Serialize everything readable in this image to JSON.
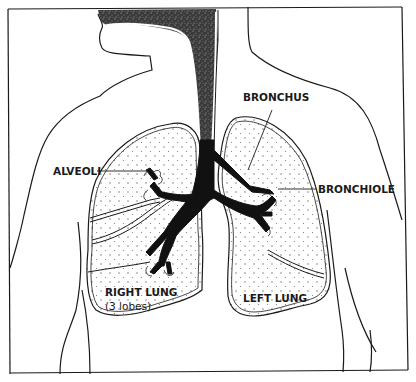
{
  "diagram": {
    "type": "anatomical-illustration",
    "colors": {
      "line": "#1a1a1a",
      "background": "#ffffff",
      "airway_fill": "#111111",
      "lung_dots": "#555555"
    }
  },
  "labels": {
    "bronchus": "BRONCHUS",
    "alveoli": "ALVEOLI",
    "bronchiole": "BRONCHIOLE",
    "right_lung": "RIGHT LUNG",
    "right_lung_note": "(3 lobes)",
    "left_lung": "LEFT LUNG"
  }
}
